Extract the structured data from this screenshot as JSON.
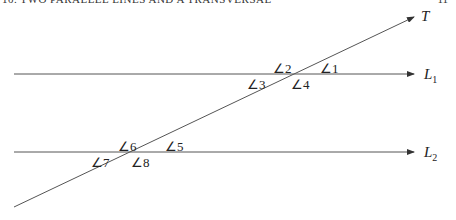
{
  "header": {
    "left_text": "10. TWO PARALLEL LINES AND A TRANSVERSAL",
    "right_text": "11"
  },
  "diagram": {
    "lines": {
      "transversal": {
        "name": "T",
        "subscript": ""
      },
      "line1": {
        "name": "L",
        "subscript": "1"
      },
      "line2": {
        "name": "L",
        "subscript": "2"
      }
    },
    "angles": {
      "a1": "∠1",
      "a2": "∠2",
      "a3": "∠3",
      "a4": "∠4",
      "a5": "∠5",
      "a6": "∠6",
      "a7": "∠7",
      "a8": "∠8"
    },
    "stroke_color": "#555555"
  }
}
